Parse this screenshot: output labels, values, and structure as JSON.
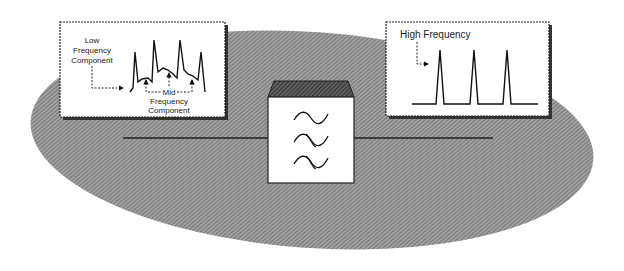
{
  "diagram": {
    "type": "frequency-filter-illustration",
    "colors": {
      "ellipse_fill": "#9a9a9a",
      "panel_fill": "#ffffff",
      "line": "#222222",
      "filter_top": "#555555"
    },
    "left_panel": {
      "label_low": [
        "Low",
        "Frequency",
        "Component"
      ],
      "label_mid_word": "Mid",
      "label_mid_rest": [
        "Frequency",
        "Component"
      ]
    },
    "right_panel": {
      "label_high": "High Frequency"
    },
    "filter_box": {
      "symbols": [
        "wave",
        "wave-crossed",
        "wave-crossed"
      ]
    }
  }
}
